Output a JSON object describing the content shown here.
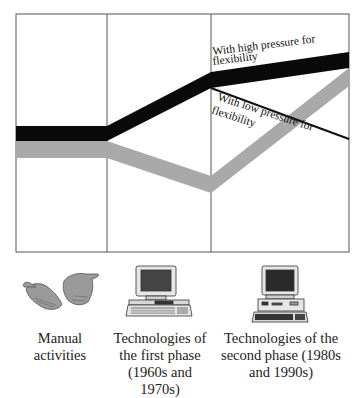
{
  "diagram": {
    "frame": {
      "x": 16,
      "y": 14,
      "width": 333,
      "height": 238,
      "stroke": "#555555"
    },
    "dividers_x": [
      107,
      211
    ],
    "colors": {
      "high_pressure_band": "#0a0a0a",
      "low_pressure_band": "#a9a9a9",
      "low_pressure_line": "#111111"
    },
    "bands": {
      "black_top": [
        [
          16,
          126
        ],
        [
          107,
          126
        ],
        [
          211,
          72
        ],
        [
          349,
          52
        ]
      ],
      "black_bottom": [
        [
          16,
          141
        ],
        [
          107,
          141
        ],
        [
          211,
          88
        ],
        [
          349,
          68
        ]
      ],
      "gray_top": [
        [
          16,
          141
        ],
        [
          107,
          141
        ],
        [
          211,
          176
        ],
        [
          349,
          68
        ]
      ],
      "gray_bottom": [
        [
          16,
          158
        ],
        [
          107,
          158
        ],
        [
          211,
          193
        ],
        [
          349,
          86
        ]
      ],
      "thin_line": [
        [
          211,
          88
        ],
        [
          349,
          139
        ]
      ]
    },
    "annotations": {
      "high": {
        "line1": "With high pressure for",
        "line2": "flexibility"
      },
      "low": {
        "line1": "With low pressure for",
        "line2": "flexibility"
      }
    }
  },
  "phases": [
    {
      "icon": "hands-icon",
      "line1": "Manual",
      "line2": "activities",
      "line3": ""
    },
    {
      "icon": "computer-first-phase-icon",
      "line1": "Technologies of",
      "line2": "the first phase",
      "line3": "(1960s and 1970s)"
    },
    {
      "icon": "computer-second-phase-icon",
      "line1": "Technologies of the",
      "line2": "second phase (1980s",
      "line3": "and 1990s)"
    }
  ]
}
